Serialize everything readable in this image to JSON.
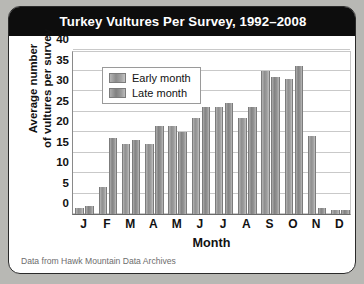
{
  "card": {
    "title": "Turkey Vultures Per Survey, 1992–2008",
    "source_note": "Data from Hawk Mountain Data Archives"
  },
  "legend": {
    "items": [
      {
        "label": "Early month",
        "color": "#8f8f8f"
      },
      {
        "label": "Late month",
        "color": "#838383"
      }
    ]
  },
  "axes": {
    "y_ticks": [
      "0",
      "5",
      "10",
      "15",
      "20",
      "25",
      "30",
      "35",
      "40"
    ],
    "y_title_line1": "Average number",
    "y_title_line2": "of vultures per survey",
    "x_title": "Month",
    "x_ticks": [
      "J",
      "F",
      "M",
      "A",
      "M",
      "J",
      "J",
      "A",
      "S",
      "O",
      "N",
      "D"
    ]
  },
  "chart_data": {
    "type": "bar",
    "title": "Turkey Vultures Per Survey, 1992–2008",
    "xlabel": "Month",
    "ylabel": "Average number of vultures per survey",
    "ylim": [
      0,
      40
    ],
    "ytick_step": 5,
    "grid": true,
    "legend_position": "upper-left-inside",
    "categories": [
      "J",
      "F",
      "M",
      "A",
      "M",
      "J",
      "J",
      "A",
      "S",
      "O",
      "N",
      "D"
    ],
    "series": [
      {
        "name": "Early month",
        "values": [
          1.5,
          6.5,
          17,
          17,
          21.5,
          23.5,
          26,
          23.5,
          35,
          33,
          19,
          1
        ]
      },
      {
        "name": "Late month",
        "values": [
          2,
          18.5,
          18,
          21.5,
          20,
          26,
          27,
          26,
          33.5,
          36,
          1.5,
          1
        ]
      }
    ]
  }
}
